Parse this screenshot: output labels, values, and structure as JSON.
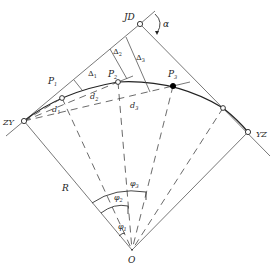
{
  "figure": {
    "type": "circular-curve-deflection-angle-layout",
    "labels": {
      "intersection_point": "JD",
      "curve_start": "ZY",
      "curve_end": "YZ",
      "center": "O",
      "radius": "R",
      "deflection_angle": "α",
      "points": [
        "P",
        "P",
        "P"
      ],
      "point_subscripts": [
        "1",
        "2",
        "3"
      ],
      "offsets": [
        "Δ",
        "Δ",
        "Δ"
      ],
      "offset_subscripts": [
        "1",
        "2",
        "3"
      ],
      "chords": [
        "d",
        "d",
        "d"
      ],
      "chord_subscripts": [
        "1",
        "2",
        "3"
      ],
      "central_angles": [
        "φ",
        "φ",
        "φ"
      ],
      "angle_subscripts": [
        "1",
        "2",
        "3"
      ]
    },
    "colors": {
      "line": "#333333",
      "background": "#ffffff",
      "filled_point": "#000000"
    }
  }
}
